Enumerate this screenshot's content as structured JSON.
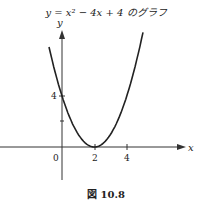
{
  "figure": {
    "title": "y = x² − 4x + 4 のグラフ",
    "caption": "図 10.8"
  },
  "axes": {
    "x_label": "x",
    "y_label": "y",
    "origin_label": "0",
    "x_ticks": [
      "2",
      "4"
    ],
    "y_ticks": [
      "4"
    ]
  },
  "curve": {
    "equation": "y = x^2 - 4x + 4",
    "vertex": [
      2,
      0
    ],
    "y_intercept": 4,
    "x_range": [
      -0.8,
      5.0
    ]
  },
  "colors": {
    "curve": "#222222",
    "axes": "#333333",
    "background": "#ffffff"
  }
}
